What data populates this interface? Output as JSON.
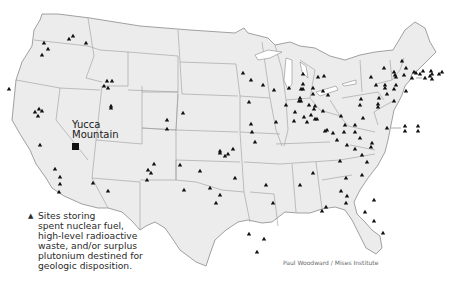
{
  "map": {
    "land_color": "#ececec",
    "border_color": "#8a8a8a",
    "marker_color": "#111111"
  },
  "label": {
    "yucca_line1": "Yucca",
    "yucca_line2": "Mountain"
  },
  "legend": {
    "marker_icon": "▲",
    "lines": [
      "Sites storing",
      "spent nuclear fuel,",
      "high-level radioactive",
      "waste, and/or surplus",
      "plutonium destined for",
      "geologic disposition."
    ]
  },
  "credit": "Paul Woodward / Mises Institute",
  "sites": [
    [
      44,
      43
    ],
    [
      48,
      49
    ],
    [
      42,
      55
    ],
    [
      69,
      39
    ],
    [
      73,
      36
    ],
    [
      86,
      43
    ],
    [
      107,
      81
    ],
    [
      112,
      81
    ],
    [
      104,
      86
    ],
    [
      108,
      88
    ],
    [
      111,
      108
    ],
    [
      9,
      89
    ],
    [
      39,
      109
    ],
    [
      35,
      112
    ],
    [
      42,
      111
    ],
    [
      38,
      116
    ],
    [
      40,
      145
    ],
    [
      55,
      169
    ],
    [
      60,
      177
    ],
    [
      60,
      184
    ],
    [
      59,
      192
    ],
    [
      93,
      183
    ],
    [
      108,
      191
    ],
    [
      111,
      106
    ],
    [
      167,
      120
    ],
    [
      167,
      129
    ],
    [
      154,
      164
    ],
    [
      148,
      170
    ],
    [
      151,
      173
    ],
    [
      147,
      180
    ],
    [
      180,
      165
    ],
    [
      184,
      190
    ],
    [
      220,
      153
    ],
    [
      225,
      156
    ],
    [
      233,
      149
    ],
    [
      228,
      154
    ],
    [
      220,
      151
    ],
    [
      200,
      171
    ],
    [
      220,
      195
    ],
    [
      210,
      188
    ],
    [
      216,
      203
    ],
    [
      243,
      73
    ],
    [
      251,
      80
    ],
    [
      263,
      85
    ],
    [
      274,
      90
    ],
    [
      249,
      102
    ],
    [
      276,
      122
    ],
    [
      251,
      124
    ],
    [
      252,
      132
    ],
    [
      255,
      142
    ],
    [
      183,
      113
    ],
    [
      235,
      178
    ],
    [
      266,
      185
    ],
    [
      273,
      203
    ],
    [
      249,
      234
    ],
    [
      257,
      252
    ],
    [
      264,
      239
    ],
    [
      286,
      105
    ],
    [
      301,
      101
    ],
    [
      318,
      77
    ],
    [
      313,
      94
    ],
    [
      303,
      89
    ],
    [
      299,
      101
    ],
    [
      315,
      106
    ],
    [
      314,
      109
    ],
    [
      311,
      115
    ],
    [
      304,
      117
    ],
    [
      307,
      122
    ],
    [
      315,
      119
    ],
    [
      325,
      131
    ],
    [
      295,
      112
    ],
    [
      294,
      121
    ],
    [
      317,
      119
    ],
    [
      303,
      74
    ],
    [
      303,
      84
    ],
    [
      289,
      88
    ],
    [
      301,
      89
    ],
    [
      300,
      98
    ],
    [
      313,
      88
    ],
    [
      323,
      91
    ],
    [
      328,
      95
    ],
    [
      324,
      76
    ],
    [
      309,
      105
    ],
    [
      327,
      130
    ],
    [
      341,
      116
    ],
    [
      323,
      111
    ],
    [
      355,
      125
    ],
    [
      355,
      132
    ],
    [
      363,
      118
    ],
    [
      387,
      128
    ],
    [
      378,
      107
    ],
    [
      376,
      85
    ],
    [
      361,
      99
    ],
    [
      360,
      105
    ],
    [
      378,
      104
    ],
    [
      379,
      98
    ],
    [
      394,
      101
    ],
    [
      394,
      89
    ],
    [
      385,
      85
    ],
    [
      396,
      85
    ],
    [
      406,
      91
    ],
    [
      396,
      77
    ],
    [
      404,
      75
    ],
    [
      406,
      68
    ],
    [
      402,
      61
    ],
    [
      371,
      77
    ],
    [
      384,
      68
    ],
    [
      394,
      72
    ],
    [
      395,
      75
    ],
    [
      412,
      78
    ],
    [
      414,
      72
    ],
    [
      416,
      73
    ],
    [
      420,
      74
    ],
    [
      423,
      71
    ],
    [
      425,
      78
    ],
    [
      431,
      71
    ],
    [
      432,
      74
    ],
    [
      439,
      74
    ],
    [
      442,
      72
    ],
    [
      430,
      76
    ],
    [
      432,
      79
    ],
    [
      385,
      88
    ],
    [
      387,
      94
    ],
    [
      333,
      133
    ],
    [
      344,
      132
    ],
    [
      345,
      125
    ],
    [
      337,
      140
    ],
    [
      347,
      145
    ],
    [
      355,
      149
    ],
    [
      362,
      155
    ],
    [
      367,
      162
    ],
    [
      371,
      147
    ],
    [
      360,
      138
    ],
    [
      340,
      161
    ],
    [
      346,
      178
    ],
    [
      341,
      191
    ],
    [
      347,
      196
    ],
    [
      346,
      203
    ],
    [
      322,
      211
    ],
    [
      313,
      173
    ],
    [
      300,
      185
    ],
    [
      326,
      207
    ],
    [
      405,
      126
    ],
    [
      418,
      126
    ],
    [
      418,
      131
    ],
    [
      405,
      131
    ],
    [
      372,
      143
    ],
    [
      362,
      175
    ],
    [
      365,
      212
    ],
    [
      374,
      221
    ],
    [
      383,
      233
    ],
    [
      374,
      200
    ]
  ]
}
